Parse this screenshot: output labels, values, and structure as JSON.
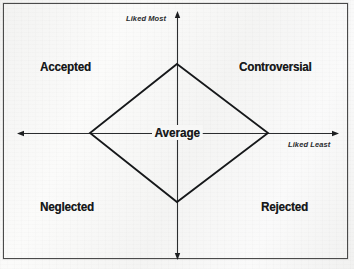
{
  "diagram": {
    "type": "quadrant-diagram",
    "background_color": "#f7f7f6",
    "line_color": "#16181a",
    "frame_color": "#4a4a4a",
    "axes": {
      "vertical": {
        "name": "liking-axis",
        "top_label": "Liked Most",
        "bottom_label": ""
      },
      "horizontal": {
        "name": "disliking-axis",
        "right_label": "Liked Least",
        "left_label": ""
      }
    },
    "center_label": "Average",
    "quadrants": [
      {
        "id": "top-left",
        "label": "Accepted"
      },
      {
        "id": "top-right",
        "label": "Controversial"
      },
      {
        "id": "bottom-left",
        "label": "Neglected"
      },
      {
        "id": "bottom-right",
        "label": "Rejected"
      }
    ],
    "shape": {
      "name": "diamond",
      "vertices": [
        {
          "position": "top",
          "x": 177,
          "y": 64
        },
        {
          "position": "right",
          "x": 268,
          "y": 133
        },
        {
          "position": "bottom",
          "x": 177,
          "y": 202
        },
        {
          "position": "left",
          "x": 90,
          "y": 133
        }
      ]
    }
  }
}
